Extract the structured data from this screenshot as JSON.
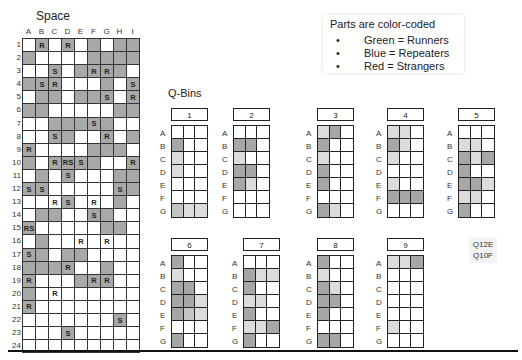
{
  "space": {
    "title": "Space",
    "columns": [
      "A",
      "B",
      "C",
      "D",
      "E",
      "F",
      "G",
      "H",
      "I"
    ],
    "rows": [
      {
        "label": "1",
        "cells": [
          [
            "",
            0
          ],
          [
            "R",
            1
          ],
          [
            "",
            0
          ],
          [
            "R",
            1
          ],
          [
            "",
            0
          ],
          [
            "",
            1
          ],
          [
            "",
            0
          ],
          [
            "",
            1
          ],
          [
            "",
            1
          ]
        ]
      },
      {
        "label": "2",
        "cells": [
          [
            "",
            1
          ],
          [
            "",
            0
          ],
          [
            "",
            0
          ],
          [
            "",
            0
          ],
          [
            "",
            0
          ],
          [
            "",
            1
          ],
          [
            "",
            1
          ],
          [
            "",
            1
          ],
          [
            "",
            1
          ]
        ]
      },
      {
        "label": "3",
        "cells": [
          [
            "",
            0
          ],
          [
            "",
            0
          ],
          [
            "S",
            1
          ],
          [
            "",
            0
          ],
          [
            "",
            1
          ],
          [
            "R",
            1
          ],
          [
            "R",
            1
          ],
          [
            "",
            1
          ],
          [
            "",
            0
          ]
        ]
      },
      {
        "label": "4",
        "cells": [
          [
            "",
            1
          ],
          [
            "S",
            1
          ],
          [
            "R",
            1
          ],
          [
            "",
            0
          ],
          [
            "",
            0
          ],
          [
            "",
            0
          ],
          [
            "",
            1
          ],
          [
            "",
            0
          ],
          [
            "S",
            1
          ]
        ]
      },
      {
        "label": "5",
        "cells": [
          [
            "",
            0
          ],
          [
            "",
            1
          ],
          [
            "",
            1
          ],
          [
            "",
            0
          ],
          [
            "",
            1
          ],
          [
            "",
            1
          ],
          [
            "S",
            1
          ],
          [
            "",
            0
          ],
          [
            "R",
            1
          ]
        ]
      },
      {
        "label": "6",
        "cells": [
          [
            "",
            1
          ],
          [
            "",
            1
          ],
          [
            "",
            0
          ],
          [
            "",
            0
          ],
          [
            "",
            0
          ],
          [
            "",
            0
          ],
          [
            "",
            0
          ],
          [
            "",
            1
          ],
          [
            "",
            1
          ]
        ]
      },
      {
        "label": "7",
        "cells": [
          [
            "",
            0
          ],
          [
            "",
            0
          ],
          [
            "",
            1
          ],
          [
            "",
            1
          ],
          [
            "",
            1
          ],
          [
            "S",
            1
          ],
          [
            "",
            1
          ],
          [
            "",
            0
          ],
          [
            "",
            0
          ]
        ]
      },
      {
        "label": "8",
        "cells": [
          [
            "",
            0
          ],
          [
            "",
            0
          ],
          [
            "S",
            1
          ],
          [
            "",
            1
          ],
          [
            "",
            0
          ],
          [
            "",
            0
          ],
          [
            "R",
            1
          ],
          [
            "",
            0
          ],
          [
            "",
            1
          ]
        ]
      },
      {
        "label": "9",
        "cells": [
          [
            "R",
            1
          ],
          [
            "",
            0
          ],
          [
            "",
            0
          ],
          [
            "",
            0
          ],
          [
            "",
            0
          ],
          [
            "",
            1
          ],
          [
            "",
            1
          ],
          [
            "",
            1
          ],
          [
            "",
            0
          ]
        ]
      },
      {
        "label": "10",
        "cells": [
          [
            "",
            1
          ],
          [
            "",
            0
          ],
          [
            "R",
            1
          ],
          [
            "RS",
            1
          ],
          [
            "S",
            1
          ],
          [
            "",
            1
          ],
          [
            "",
            0
          ],
          [
            "",
            0
          ],
          [
            "R",
            1
          ]
        ]
      },
      {
        "label": "11",
        "cells": [
          [
            "",
            0
          ],
          [
            "",
            1
          ],
          [
            "",
            0
          ],
          [
            "S",
            1
          ],
          [
            "",
            0
          ],
          [
            "",
            0
          ],
          [
            "",
            0
          ],
          [
            "",
            1
          ],
          [
            "",
            1
          ]
        ]
      },
      {
        "label": "12",
        "cells": [
          [
            "S",
            1
          ],
          [
            "S",
            1
          ],
          [
            "",
            0
          ],
          [
            "",
            0
          ],
          [
            "",
            0
          ],
          [
            "",
            0
          ],
          [
            "",
            0
          ],
          [
            "S",
            1
          ],
          [
            "",
            1
          ]
        ]
      },
      {
        "label": "13",
        "cells": [
          [
            "",
            0
          ],
          [
            "",
            0
          ],
          [
            "R",
            0
          ],
          [
            "S",
            1
          ],
          [
            "",
            0
          ],
          [
            "R",
            0
          ],
          [
            "",
            0
          ],
          [
            "",
            1
          ],
          [
            "",
            0
          ]
        ]
      },
      {
        "label": "14",
        "cells": [
          [
            "",
            0
          ],
          [
            "",
            1
          ],
          [
            "",
            1
          ],
          [
            "",
            0
          ],
          [
            "",
            0
          ],
          [
            "S",
            1
          ],
          [
            "",
            1
          ],
          [
            "",
            0
          ],
          [
            "",
            0
          ]
        ]
      },
      {
        "label": "15",
        "cells": [
          [
            "RS",
            1
          ],
          [
            "",
            0
          ],
          [
            "",
            0
          ],
          [
            "",
            0
          ],
          [
            "",
            0
          ],
          [
            "",
            0
          ],
          [
            "",
            1
          ],
          [
            "",
            1
          ],
          [
            "",
            0
          ]
        ]
      },
      {
        "label": "16",
        "cells": [
          [
            "",
            0
          ],
          [
            "",
            1
          ],
          [
            "",
            0
          ],
          [
            "",
            0
          ],
          [
            "R",
            0
          ],
          [
            "",
            0
          ],
          [
            "R",
            0
          ],
          [
            "",
            0
          ],
          [
            "",
            0
          ]
        ]
      },
      {
        "label": "17",
        "cells": [
          [
            "S",
            1
          ],
          [
            "",
            1
          ],
          [
            "",
            0
          ],
          [
            "",
            1
          ],
          [
            "",
            1
          ],
          [
            "",
            0
          ],
          [
            "",
            0
          ],
          [
            "",
            0
          ],
          [
            "",
            0
          ]
        ]
      },
      {
        "label": "18",
        "cells": [
          [
            "",
            1
          ],
          [
            "",
            1
          ],
          [
            "",
            1
          ],
          [
            "R",
            1
          ],
          [
            "",
            0
          ],
          [
            "",
            0
          ],
          [
            "",
            1
          ],
          [
            "",
            0
          ],
          [
            "",
            0
          ]
        ]
      },
      {
        "label": "19",
        "cells": [
          [
            "R",
            1
          ],
          [
            "",
            0
          ],
          [
            "",
            0
          ],
          [
            "",
            0
          ],
          [
            "",
            1
          ],
          [
            "R",
            1
          ],
          [
            "R",
            1
          ],
          [
            "",
            0
          ],
          [
            "",
            0
          ]
        ]
      },
      {
        "label": "20",
        "cells": [
          [
            "",
            1
          ],
          [
            "",
            0
          ],
          [
            "R",
            0
          ],
          [
            "",
            0
          ],
          [
            "",
            0
          ],
          [
            "",
            0
          ],
          [
            "",
            0
          ],
          [
            "",
            0
          ],
          [
            "",
            0
          ]
        ]
      },
      {
        "label": "21",
        "cells": [
          [
            "R",
            1
          ],
          [
            "",
            0
          ],
          [
            "",
            0
          ],
          [
            "",
            0
          ],
          [
            "",
            0
          ],
          [
            "",
            0
          ],
          [
            "",
            0
          ],
          [
            "",
            0
          ],
          [
            "",
            0
          ]
        ]
      },
      {
        "label": "22",
        "cells": [
          [
            "",
            0
          ],
          [
            "",
            0
          ],
          [
            "",
            0
          ],
          [
            "",
            0
          ],
          [
            "",
            0
          ],
          [
            "",
            0
          ],
          [
            "",
            0
          ],
          [
            "S",
            1
          ],
          [
            "",
            0
          ]
        ]
      },
      {
        "label": "23",
        "cells": [
          [
            "",
            0
          ],
          [
            "",
            0
          ],
          [
            "",
            0
          ],
          [
            "S",
            1
          ],
          [
            "",
            0
          ],
          [
            "",
            0
          ],
          [
            "",
            0
          ],
          [
            "",
            0
          ],
          [
            "",
            0
          ]
        ]
      },
      {
        "label": "24",
        "cells": [
          [
            "",
            0
          ],
          [
            "",
            0
          ],
          [
            "",
            0
          ],
          [
            "",
            0
          ],
          [
            "",
            0
          ],
          [
            "",
            0
          ],
          [
            "",
            0
          ],
          [
            "",
            0
          ],
          [
            "",
            0
          ]
        ]
      }
    ]
  },
  "legend": {
    "title": "Parts are color-coded",
    "bullet": "•",
    "items": [
      "Green = Runners",
      "Blue = Repeaters",
      "Red = Strangers"
    ]
  },
  "qbins": {
    "title": "Q-Bins",
    "row_labels": [
      "A",
      "B",
      "C",
      "D",
      "E",
      "F",
      "G"
    ],
    "shade_colors": {
      "dark": "#a7a7a7",
      "mid": "#c4c4c4",
      "light": "#dcdcdc"
    },
    "bins": [
      {
        "label": "1",
        "x": 160,
        "y": 108,
        "cells": [
          "---",
          "d--",
          "l--",
          "l--",
          "---",
          "---",
          "mll"
        ]
      },
      {
        "label": "2",
        "x": 222,
        "y": 108,
        "cells": [
          "---",
          "dd-",
          "l--",
          "dd-",
          "dl-",
          "---",
          "---"
        ]
      },
      {
        "label": "3",
        "x": 306,
        "y": 108,
        "cells": [
          "ld-",
          "d--",
          "l--",
          "d--",
          "d--",
          "---",
          "dl-"
        ]
      },
      {
        "label": "4",
        "x": 376,
        "y": 108,
        "cells": [
          "ll-",
          "dl-",
          "l--",
          "---",
          "l--",
          "ddd",
          "---"
        ]
      },
      {
        "label": "5",
        "x": 447,
        "y": 108,
        "cells": [
          "---",
          "ll-",
          "dld",
          "d--",
          "ddl",
          "ll-",
          "d--"
        ]
      },
      {
        "label": "6",
        "x": 160,
        "y": 238,
        "cells": [
          "d--",
          "l--",
          "dd-",
          "ddl",
          "dml",
          "---",
          "d--"
        ]
      },
      {
        "label": "7",
        "x": 232,
        "y": 238,
        "cells": [
          "---",
          "dll",
          "d--",
          "ll-",
          "d--",
          "lld",
          "d--"
        ]
      },
      {
        "label": "8",
        "x": 306,
        "y": 238,
        "cells": [
          "d--",
          "l--",
          "dl-",
          "dd-",
          "d--",
          "---",
          "dd-"
        ]
      },
      {
        "label": "9",
        "x": 376,
        "y": 238,
        "cells": [
          "lld",
          "---",
          "---",
          "---",
          "---",
          "l--",
          "---"
        ]
      }
    ]
  },
  "notes": [
    "Q12E",
    "Q10F"
  ]
}
